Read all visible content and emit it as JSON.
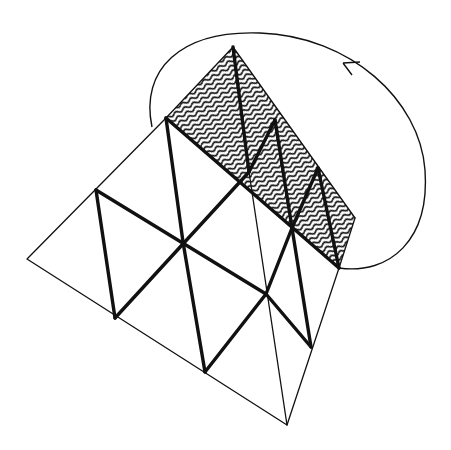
{
  "diagram": {
    "title": "Folded triangular net with hatched strip and rotation arrow",
    "colors": {
      "stroke": "#111111",
      "background": "#ffffff",
      "hatch": "#111111"
    },
    "elements": {
      "outer_triangle": "outer-triangle",
      "hatched_strip": "hatched-strip",
      "fold_arrow": "curved-rotation-arrow"
    }
  }
}
